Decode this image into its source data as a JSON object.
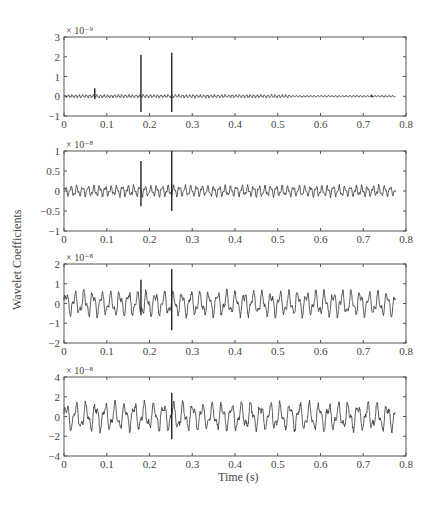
{
  "figure": {
    "ylabel": "Wavelet Coefficients",
    "xlabel": "Time (s)"
  },
  "chart_data": [
    {
      "type": "line",
      "title": "",
      "xlabel": "",
      "ylabel": "Wavelet Coefficients",
      "scale_label": "× 10⁻⁹",
      "xlim": [
        0,
        0.8
      ],
      "ylim": [
        -1,
        3
      ],
      "xticks": [
        0,
        0.1,
        0.2,
        0.3,
        0.4,
        0.5,
        0.6,
        0.7,
        0.8
      ],
      "xtick_labels": [
        "0",
        "0.1",
        "0.2",
        "0.3",
        "0.4",
        "0.5",
        "0.6",
        "0.7",
        "0.8"
      ],
      "yticks": [
        -1,
        0,
        1,
        2,
        3
      ],
      "ytick_labels": [
        "−1",
        "0",
        "1",
        "2",
        "3"
      ],
      "grid": false,
      "signal": {
        "x_end": 0.775,
        "baseline_amp": 0.06,
        "dense_amp_until": 0.53,
        "dense_amp": 0.1,
        "freq": 120,
        "seed": 1
      },
      "spikes": [
        {
          "x": 0.072,
          "high": 0.4,
          "low": -0.15
        },
        {
          "x": 0.18,
          "high": 2.1,
          "low": -0.8
        },
        {
          "x": 0.252,
          "high": 2.2,
          "low": -0.8
        },
        {
          "x": 0.72,
          "high": 0.08,
          "low": -0.05
        }
      ]
    },
    {
      "type": "line",
      "title": "",
      "xlabel": "",
      "ylabel": "Wavelet Coefficients",
      "scale_label": "× 10⁻⁸",
      "xlim": [
        0,
        0.8
      ],
      "ylim": [
        -1,
        1
      ],
      "xticks": [
        0,
        0.1,
        0.2,
        0.3,
        0.4,
        0.5,
        0.6,
        0.7,
        0.8
      ],
      "xtick_labels": [
        "0",
        "0.1",
        "0.2",
        "0.3",
        "0.4",
        "0.5",
        "0.6",
        "0.7",
        "0.8"
      ],
      "yticks": [
        -1,
        -0.5,
        0,
        0.5,
        1
      ],
      "ytick_labels": [
        "−1",
        "−0.5",
        "0",
        "0.5",
        "1"
      ],
      "grid": false,
      "signal": {
        "x_end": 0.775,
        "baseline_amp": 0.17,
        "freq": 75,
        "seed": 2
      },
      "spikes": [
        {
          "x": 0.18,
          "high": 0.75,
          "low": -0.38
        },
        {
          "x": 0.252,
          "high": 1.0,
          "low": -0.5
        }
      ]
    },
    {
      "type": "line",
      "title": "",
      "xlabel": "",
      "ylabel": "Wavelet Coefficients",
      "scale_label": "× 10⁻⁸",
      "xlim": [
        0,
        0.8
      ],
      "ylim": [
        -2,
        2
      ],
      "xticks": [
        0,
        0.1,
        0.2,
        0.3,
        0.4,
        0.5,
        0.6,
        0.7,
        0.8
      ],
      "xtick_labels": [
        "0",
        "0.1",
        "0.2",
        "0.3",
        "0.4",
        "0.5",
        "0.6",
        "0.7",
        "0.8"
      ],
      "yticks": [
        -2,
        -1,
        0,
        1,
        2
      ],
      "ytick_labels": [
        "−2",
        "−1",
        "0",
        "1",
        "2"
      ],
      "grid": false,
      "signal": {
        "x_end": 0.775,
        "baseline_amp": 0.75,
        "freq": 48,
        "seed": 3
      },
      "spikes": [
        {
          "x": 0.18,
          "high": 1.2,
          "low": -0.6
        },
        {
          "x": 0.252,
          "high": 1.75,
          "low": -1.35
        }
      ]
    },
    {
      "type": "line",
      "title": "",
      "xlabel": "Time (s)",
      "ylabel": "Wavelet Coefficients",
      "scale_label": "× 10⁻⁸",
      "xlim": [
        0,
        0.8
      ],
      "ylim": [
        -4,
        4
      ],
      "xticks": [
        0,
        0.1,
        0.2,
        0.3,
        0.4,
        0.5,
        0.6,
        0.7,
        0.8
      ],
      "xtick_labels": [
        "0",
        "0.1",
        "0.2",
        "0.3",
        "0.4",
        "0.5",
        "0.6",
        "0.7",
        "0.8"
      ],
      "yticks": [
        -4,
        -2,
        0,
        2,
        4
      ],
      "ytick_labels": [
        "−4",
        "−2",
        "0",
        "2",
        "4"
      ],
      "grid": false,
      "signal": {
        "x_end": 0.775,
        "baseline_amp": 1.7,
        "freq": 44,
        "seed": 4
      },
      "spikes": [
        {
          "x": 0.252,
          "high": 2.4,
          "low": -2.3
        }
      ]
    }
  ]
}
